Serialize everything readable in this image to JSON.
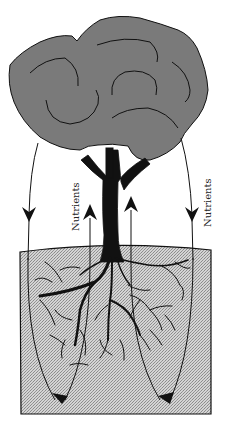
{
  "diagram": {
    "labels": {
      "nutrients_left": "Nutrients",
      "nutrients_right": "Nutrients"
    },
    "colors": {
      "canopy_fill": "#7a7a7a",
      "soil_fill": "#c8c8c8",
      "trunk": "#111111",
      "outline": "#111111",
      "background": "#ffffff"
    },
    "elements": [
      "tree-canopy",
      "tree-trunk",
      "root-system",
      "soil-block",
      "downward-arrow-left",
      "downward-arrow-right",
      "upward-arrow-left",
      "upward-arrow-right",
      "soil-return-arrow-left",
      "soil-return-arrow-right"
    ]
  }
}
